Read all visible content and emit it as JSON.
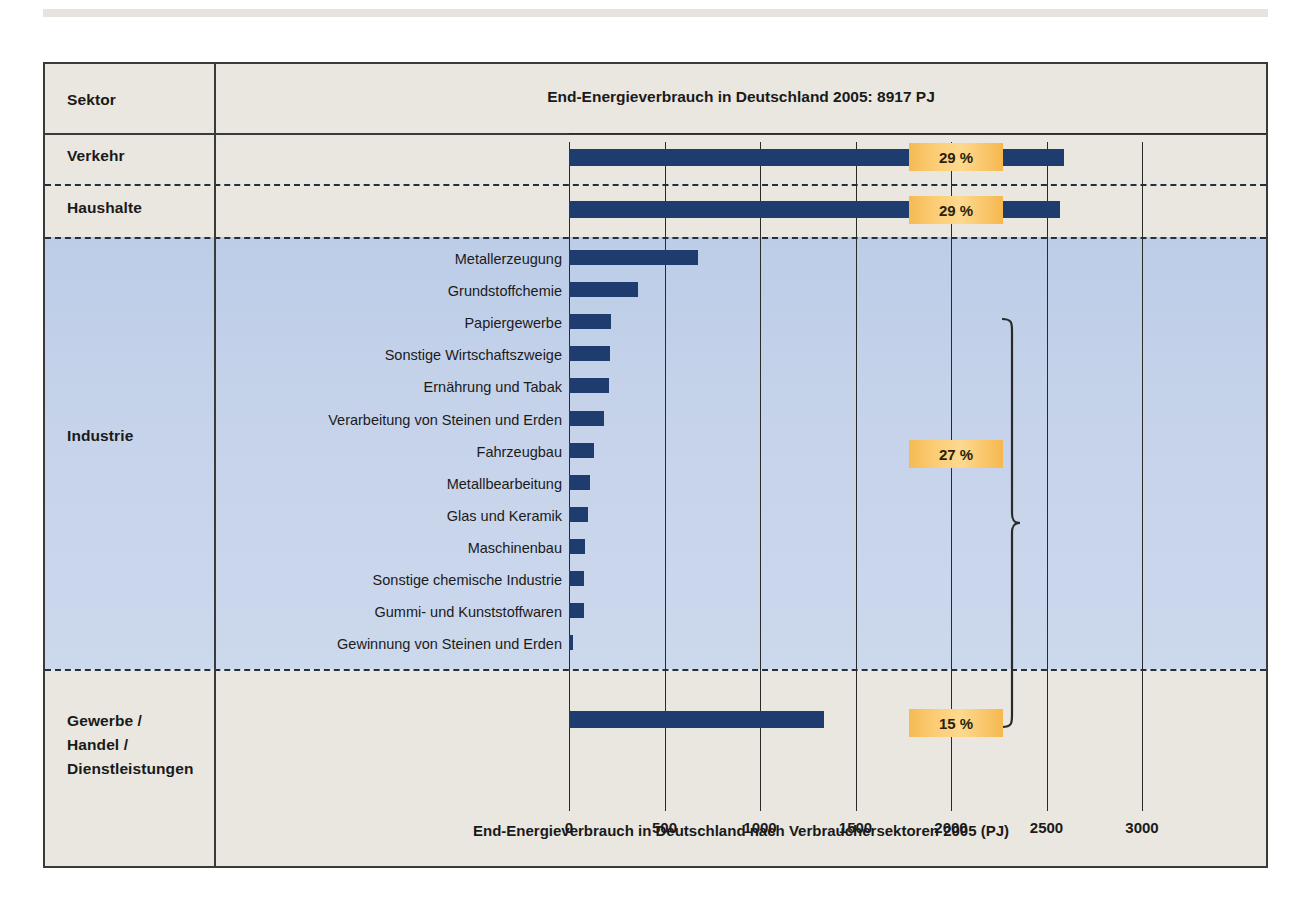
{
  "figure": {
    "header_column_label": "Sektor",
    "title": "End-Energieverbrauch in Deutschland 2005: 8917 PJ",
    "axis_caption": "End-Energieverbrauch in Deutschland nach Verbrauchersektoren 2005 (PJ)"
  },
  "colors": {
    "bar": "#1e3d6e",
    "badge": "#f6bb55",
    "industry_band": "#c6d3ea",
    "paper": "#e9e7e0",
    "ink": "#1a1a1a"
  },
  "sectors": [
    {
      "label": "Verkehr",
      "percent": "29 %"
    },
    {
      "label": "Haushalte",
      "percent": "29 %"
    },
    {
      "label": "Industrie",
      "percent": "27 %"
    },
    {
      "label": "Gewerbe /\nHandel /\nDienstleistungen",
      "percent": "15 %"
    }
  ],
  "sector_labels": {
    "verkehr": "Verkehr",
    "haushalte": "Haushalte",
    "industrie": "Industrie",
    "gewerbe_line1": "Gewerbe /",
    "gewerbe_line2": "Handel /",
    "gewerbe_line3": "Dienstleistungen"
  },
  "badges": {
    "verkehr": "29 %",
    "haushalte": "29 %",
    "industrie": "27 %",
    "gewerbe": "15 %"
  },
  "chart_data": {
    "type": "bar",
    "orientation": "horizontal",
    "title": "End-Energieverbrauch in Deutschland 2005: 8917 PJ",
    "xlabel": "End-Energieverbrauch in Deutschland nach Verbrauchersektoren 2005 (PJ)",
    "ylabel": "",
    "unit": "PJ",
    "total": 8917,
    "xlim": [
      0,
      3000
    ],
    "xticks": [
      0,
      500,
      1000,
      1500,
      2000,
      2500,
      3000
    ],
    "xtick_labels": [
      "0",
      "500",
      "1000",
      "1500",
      "2000",
      "2500",
      "3000"
    ],
    "grid": true,
    "legend": "none",
    "categories": [
      "Verkehr",
      "Haushalte",
      "Metallerzeugung",
      "Grundstoffchemie",
      "Papiergewerbe",
      "Sonstige Wirtschaftszweige",
      "Ernährung und Tabak",
      "Verarbeitung von Steinen und Erden",
      "Fahrzeugbau",
      "Metallbearbeitung",
      "Glas und Keramik",
      "Maschinenbau",
      "Sonstige chemische Industrie",
      "Gummi- und Kunststoffwaren",
      "Gewinnung von Steinen und Erden",
      "Gewerbe / Handel / Dienstleistungen"
    ],
    "values": [
      2590,
      2570,
      675,
      360,
      220,
      215,
      210,
      185,
      130,
      110,
      100,
      85,
      80,
      80,
      20,
      1335
    ],
    "sector_shares_percent": {
      "Verkehr": 29,
      "Haushalte": 29,
      "Industrie": 27,
      "Gewerbe / Handel / Dienstleistungen": 15
    },
    "annotations": [
      {
        "text": "29 %",
        "attached_to": "Verkehr"
      },
      {
        "text": "29 %",
        "attached_to": "Haushalte"
      },
      {
        "text": "27 %",
        "attached_to": "Industrie (brace over 13 branches)"
      },
      {
        "text": "15 %",
        "attached_to": "Gewerbe / Handel / Dienstleistungen"
      }
    ]
  },
  "industry_rows": [
    {
      "label": "Metallerzeugung",
      "value": 675
    },
    {
      "label": "Grundstoffchemie",
      "value": 360
    },
    {
      "label": "Papiergewerbe",
      "value": 220
    },
    {
      "label": "Sonstige Wirtschaftszweige",
      "value": 215
    },
    {
      "label": "Ernährung und Tabak",
      "value": 210
    },
    {
      "label": "Verarbeitung von Steinen und Erden",
      "value": 185
    },
    {
      "label": "Fahrzeugbau",
      "value": 130
    },
    {
      "label": "Metallbearbeitung",
      "value": 110
    },
    {
      "label": "Glas und Keramik",
      "value": 100
    },
    {
      "label": "Maschinenbau",
      "value": 85
    },
    {
      "label": "Sonstige chemische Industrie",
      "value": 80
    },
    {
      "label": "Gummi- und Kunststoffwaren",
      "value": 80
    },
    {
      "label": "Gewinnung von Steinen und Erden",
      "value": 20
    }
  ],
  "axis": {
    "ticks": [
      "0",
      "500",
      "1000",
      "1500",
      "2000",
      "2500",
      "3000"
    ]
  }
}
